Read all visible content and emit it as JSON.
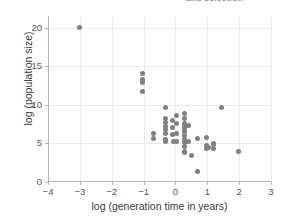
{
  "figure": {
    "top_caption_fragment": "and selection",
    "marker_color": "#808080",
    "grid_color": "#eaeaea",
    "axis_color": "#b4b4b4",
    "background_color": "#ffffff"
  },
  "chart_data": {
    "type": "scatter",
    "title": "",
    "xlabel": "log (generation time in years)",
    "ylabel": "log (population size)",
    "xlim": [
      -4,
      3
    ],
    "ylim": [
      0,
      21.5
    ],
    "grid": true,
    "legend": null,
    "xticks": [
      -4,
      -3,
      -2,
      -1,
      0,
      1,
      2,
      3
    ],
    "xticklabels": [
      "−4",
      "−3",
      "−2",
      "−1",
      "0",
      "1",
      "2",
      "3"
    ],
    "yticks": [
      0,
      5,
      10,
      15,
      20
    ],
    "yticklabels": [
      "0",
      "5",
      "10",
      "15",
      "20"
    ],
    "series": [
      {
        "name": "species",
        "marker": "circle",
        "color": "#808080",
        "points": [
          [
            -3.0,
            20.0
          ],
          [
            -1.02,
            14.0
          ],
          [
            -1.02,
            13.3
          ],
          [
            -1.02,
            12.95
          ],
          [
            -1.02,
            11.7
          ],
          [
            -0.7,
            6.3
          ],
          [
            -0.7,
            5.6
          ],
          [
            -0.3,
            9.7
          ],
          [
            -0.3,
            8.2
          ],
          [
            -0.3,
            7.7
          ],
          [
            -0.3,
            7.2
          ],
          [
            -0.3,
            6.8
          ],
          [
            -0.3,
            6.3
          ],
          [
            -0.3,
            5.5
          ],
          [
            -0.3,
            5.3
          ],
          [
            -0.08,
            8.0
          ],
          [
            -0.08,
            7.1
          ],
          [
            -0.08,
            6.2
          ],
          [
            -0.05,
            5.2
          ],
          [
            0.02,
            8.6
          ],
          [
            0.02,
            7.6
          ],
          [
            0.02,
            6.3
          ],
          [
            0.02,
            5.3
          ],
          [
            0.3,
            8.9
          ],
          [
            0.3,
            8.2
          ],
          [
            0.3,
            7.6
          ],
          [
            0.3,
            7.2
          ],
          [
            0.3,
            6.9
          ],
          [
            0.3,
            6.5
          ],
          [
            0.3,
            6.0
          ],
          [
            0.3,
            5.5
          ],
          [
            0.3,
            5.1
          ],
          [
            0.3,
            4.6
          ],
          [
            0.3,
            4.0
          ],
          [
            0.3,
            3.8
          ],
          [
            0.42,
            7.3
          ],
          [
            0.42,
            5.2
          ],
          [
            0.5,
            3.45
          ],
          [
            0.68,
            5.6
          ],
          [
            0.7,
            1.4
          ],
          [
            0.98,
            5.8
          ],
          [
            0.98,
            4.7
          ],
          [
            0.98,
            4.4
          ],
          [
            1.05,
            4.5
          ],
          [
            1.18,
            5.0
          ],
          [
            1.18,
            4.9
          ],
          [
            1.18,
            4.3
          ],
          [
            1.45,
            9.6
          ],
          [
            1.98,
            3.9
          ]
        ]
      }
    ]
  }
}
